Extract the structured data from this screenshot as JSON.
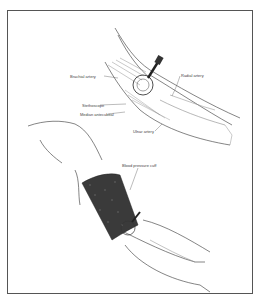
{
  "figure": {
    "panels": [
      {
        "name": "elbow-anatomy",
        "labels": {
          "brachial_artery": "Brachial artery",
          "radial_artery": "Radial artery",
          "stethoscope": "Stethoscope",
          "median_antecubital": "Median antecubital",
          "ulnar_artery": "Ulnar artery"
        }
      },
      {
        "name": "arm-with-cuff",
        "labels": {
          "blood_pressure_cuff": "Blood pressure cuff"
        }
      }
    ],
    "colors": {
      "border": "#555555",
      "line": "#333333",
      "cuff": "#3a3a3a",
      "background": "#ffffff"
    }
  }
}
